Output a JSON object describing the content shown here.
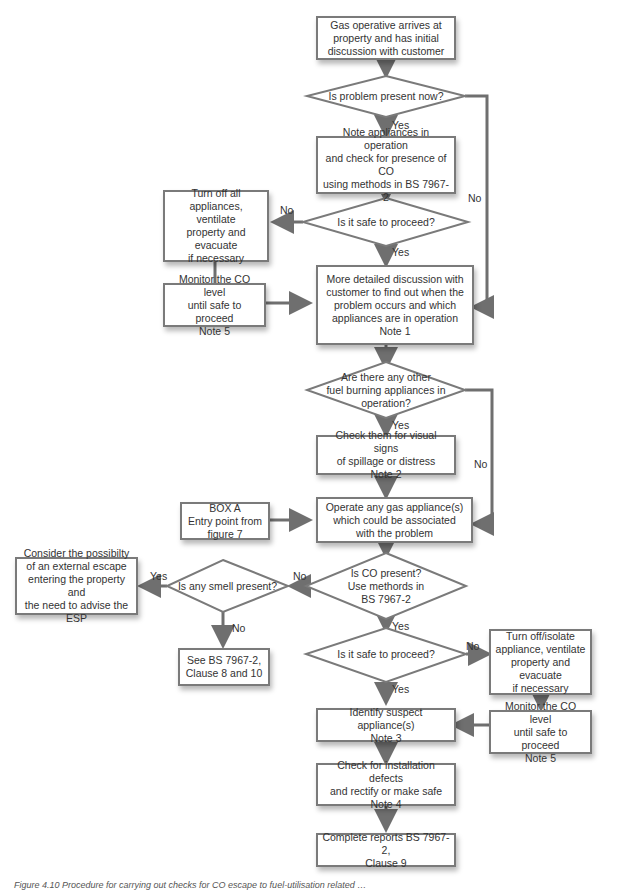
{
  "nodes": {
    "start": "Gas operative arrives at\nproperty and has initial\ndiscussion with customer",
    "q_problem_now": "Is problem present now?",
    "note_appliances": "Note appliances in operation\nand check for presence of CO\nusing methods in BS 7967-2",
    "q_safe_1": "Is it safe to proceed?",
    "turn_off_all": "Turn off all\nappliances, ventilate\nproperty and evacuate\nif necessary",
    "monitor_1": "Monitor the CO level\nuntil safe to proceed\nNote 5",
    "detailed_discussion": "More detailed discussion with\ncustomer to find out when the\nproblem occurs and which\nappliances are in operation\nNote 1",
    "q_other_fuel": "Are there any other\nfuel burning appliances in\noperation?",
    "check_visual": "Check them for visual signs\nof spillage or distress\nNote 2",
    "box_a": "BOX A\nEntry point from\nfigure 7",
    "operate_gas": "Operate any gas appliance(s)\nwhich could be associated\nwith the problem",
    "q_co_present": "Is CO present?\nUse methords in\nBS 7967-2",
    "q_smell": "Is any smell present?",
    "external_escape": "Consider the possibilty\nof an external escape\nentering the property and\nthe need to advise the ESP",
    "see_bs": "See BS 7967-2,\nClause 8 and 10",
    "q_safe_2": "Is it safe to proceed?",
    "turn_off_isolate": "Turn off/isolate\nappliance, ventilate\nproperty and evacuate\nif necessary",
    "monitor_2": "Monitor the CO level\nuntil safe to proceed\nNote 5",
    "identify_suspect": "Identify suspect appliance(s)\nNote 3",
    "check_defects": "Check for installation defects\nand rectify or make safe\nNote 4",
    "complete_reports": "Complete reports BS 7967-2,\nClause 9"
  },
  "labels": {
    "yes": "Yes",
    "no": "No"
  },
  "caption": "Figure 4.10 Procedure for carrying out checks for CO escape to fuel-utilisation related …",
  "colors": {
    "line": "#6f6f6f",
    "border": "#7a7a7a",
    "text": "#333333"
  }
}
